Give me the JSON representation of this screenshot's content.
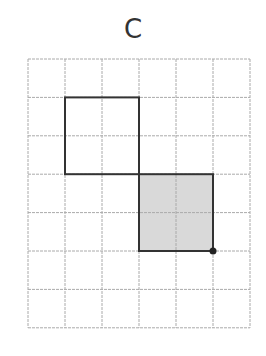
{
  "title": "C",
  "grid": {
    "cols": 6,
    "rows": 7,
    "origin_x": 28,
    "origin_y": 59,
    "cell_w": 37,
    "cell_h": 38.4,
    "line_color": "#aaaaaa"
  },
  "shapes": [
    {
      "name": "outlined-square",
      "col": 1,
      "row": 1,
      "w": 2,
      "h": 2,
      "fill": "#ffffff",
      "stroke": "#333333"
    },
    {
      "name": "shaded-square",
      "col": 3,
      "row": 3,
      "w": 2,
      "h": 2,
      "fill": "#d9d9d9",
      "stroke": "#333333"
    }
  ],
  "point": {
    "col": 5,
    "row": 5,
    "color": "#222222"
  }
}
